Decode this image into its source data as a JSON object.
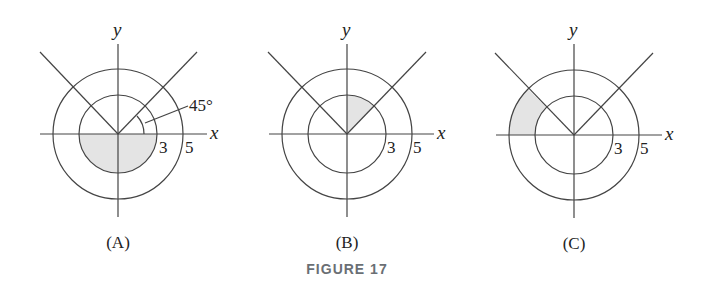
{
  "figure": {
    "caption": "FIGURE 17",
    "shade_color": "#e4e4e4",
    "line_color": "#444444",
    "caption_color": "#6a6f74"
  },
  "panels": [
    {
      "label": "(A)",
      "x_label": "x",
      "y_label": "y",
      "inner_radius_label": "3",
      "outer_radius_label": "5",
      "angle_label": "45°",
      "shaded": "lower half of inner disk (r ≤ 3, π ≤ θ ≤ 2π)"
    },
    {
      "label": "(B)",
      "x_label": "x",
      "y_label": "y",
      "inner_radius_label": "3",
      "outer_radius_label": "5",
      "shaded": "inner sector r ≤ 3, π/4 ≤ θ ≤ π/2"
    },
    {
      "label": "(C)",
      "x_label": "x",
      "y_label": "y",
      "inner_radius_label": "3",
      "outer_radius_label": "5",
      "shaded": "annular sector 3 ≤ r ≤ 5, 3π/4 ≤ θ ≤ π"
    }
  ]
}
